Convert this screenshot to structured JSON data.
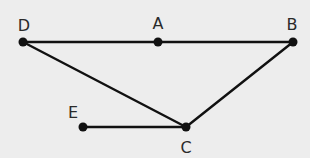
{
  "diagram": {
    "background": "#ededed",
    "line_color": "#111111",
    "points": [
      {
        "id": "D",
        "label": "D",
        "x": 23,
        "y": 42,
        "lx": 24,
        "ly": 31
      },
      {
        "id": "A",
        "label": "A",
        "x": 158,
        "y": 42,
        "lx": 158,
        "ly": 29
      },
      {
        "id": "B",
        "label": "B",
        "x": 293,
        "y": 42,
        "lx": 292,
        "ly": 30
      },
      {
        "id": "C",
        "label": "C",
        "x": 186,
        "y": 127,
        "lx": 186,
        "ly": 153
      },
      {
        "id": "E",
        "label": "E",
        "x": 83,
        "y": 127,
        "lx": 73,
        "ly": 118
      }
    ],
    "segments": [
      {
        "from": "D",
        "to": "B"
      },
      {
        "from": "D",
        "to": "C"
      },
      {
        "from": "B",
        "to": "C"
      },
      {
        "from": "E",
        "to": "C"
      }
    ]
  }
}
